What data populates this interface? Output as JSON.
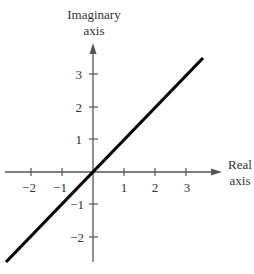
{
  "diagram": {
    "type": "complex-plane",
    "y_axis_label": [
      "Imaginary",
      "axis"
    ],
    "x_axis_label": [
      "Real",
      "axis"
    ],
    "x_ticks": [
      "−2",
      "−1",
      "1",
      "2",
      "3"
    ],
    "y_ticks": [
      "3",
      "2",
      "1",
      "−1",
      "−2"
    ],
    "line": {
      "description": "line through origin with slope 1 (Re = Im)",
      "color": "#000000"
    },
    "axis_color": "#555555"
  }
}
